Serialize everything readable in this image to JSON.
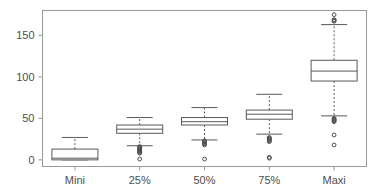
{
  "chart_data": {
    "type": "box",
    "title": "",
    "xlabel": "",
    "ylabel": "",
    "categories": [
      "Mini",
      "25%",
      "50%",
      "75%",
      "Maxi"
    ],
    "ylim": [
      -8,
      180
    ],
    "yticks": [
      0,
      50,
      100,
      150
    ],
    "ytick_labels": [
      "0",
      "50",
      "100",
      "150"
    ],
    "grid": false,
    "legend": "none",
    "frame": true,
    "boxes": [
      {
        "category": "Mini",
        "whisker_low": 0,
        "q1": 0,
        "median": 2,
        "q3": 13,
        "whisker_high": 27,
        "outliers": []
      },
      {
        "category": "25%",
        "whisker_low": 17,
        "q1": 32,
        "median": 37,
        "q3": 42,
        "whisker_high": 51,
        "outliers": [
          16,
          15,
          14,
          13,
          12,
          11,
          10,
          9,
          8,
          1
        ]
      },
      {
        "category": "50%",
        "whisker_low": 24,
        "q1": 42,
        "median": 46,
        "q3": 51,
        "whisker_high": 63,
        "outliers": [
          23,
          22,
          21,
          20,
          19,
          18,
          1
        ]
      },
      {
        "category": "75%",
        "whisker_low": 31,
        "q1": 49,
        "median": 55,
        "q3": 60,
        "whisker_high": 79,
        "outliers": [
          27,
          26,
          25,
          24,
          23,
          22,
          3,
          2
        ]
      },
      {
        "category": "Maxi",
        "whisker_low": 53,
        "q1": 95,
        "median": 107,
        "q3": 120,
        "whisker_high": 163,
        "outliers": [
          175,
          169,
          168,
          167,
          50,
          49,
          48,
          47,
          46,
          30,
          18
        ]
      }
    ],
    "colors": {
      "line": "#595959",
      "frame": "#9a9a9a",
      "text": "#4d4d4d",
      "background": "#ffffff",
      "box_fill": "#ffffff",
      "outlier_stroke": "#4d4d4d"
    }
  }
}
